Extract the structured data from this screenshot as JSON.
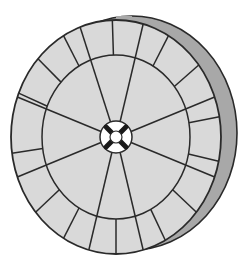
{
  "diagram": {
    "canvas": {
      "width": 252,
      "height": 264,
      "background": "#ffffff"
    },
    "colors": {
      "face_fill": "#d9d9d9",
      "rim_fill": "#a8a8a8",
      "line": "#2a2a2a",
      "hub_fill": "#ffffff",
      "hub_spokes": "#1a1a1a"
    },
    "face": {
      "cx": 116,
      "cy": 137,
      "rx": 105,
      "ry": 117
    },
    "rim": {
      "offset_x": 16,
      "offset_y": -4
    },
    "inner_ring": {
      "rx": 74,
      "ry": 82
    },
    "hub": {
      "rx": 16,
      "ry": 16,
      "inner_r": 6
    },
    "inner_spoke_angles_deg": [
      -110,
      -75,
      -20,
      20,
      75,
      105,
      160,
      200
    ],
    "outer_divider_angles_deg": [
      -92,
      -60,
      -38,
      -10,
      12,
      40,
      62,
      90,
      120,
      140,
      172,
      202,
      222,
      240
    ]
  }
}
